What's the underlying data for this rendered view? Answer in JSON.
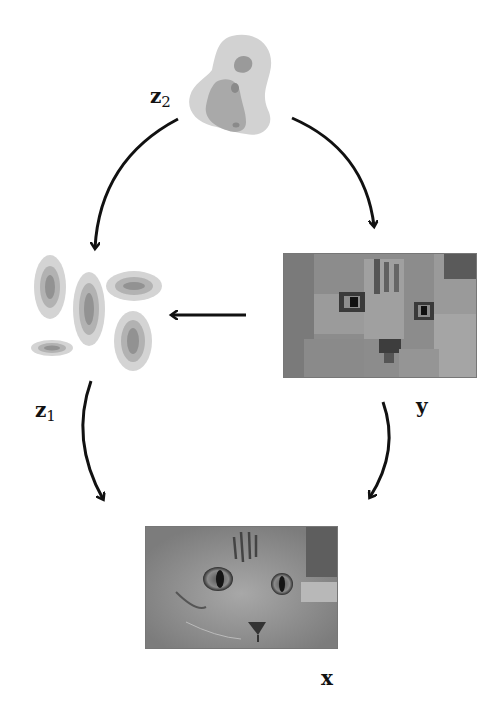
{
  "diagram": {
    "type": "latent-variable-graphical-model",
    "nodes": [
      {
        "id": "z2",
        "label_main": "z",
        "label_sub": "2",
        "depiction": "multimodal density blob (grayscale contour)"
      },
      {
        "id": "z1",
        "label_main": "z",
        "label_sub": "1",
        "depiction": "five elliptical Gaussian density contours"
      },
      {
        "id": "y",
        "label_main": "y",
        "label_sub": "",
        "depiction": "low-resolution (pixelated) cat face image"
      },
      {
        "id": "x",
        "label_main": "x",
        "label_sub": "",
        "depiction": "high-resolution cat face image"
      }
    ],
    "edges": [
      {
        "from": "z2",
        "to": "z1",
        "style": "curved arrow"
      },
      {
        "from": "z2",
        "to": "y",
        "style": "curved arrow"
      },
      {
        "from": "y",
        "to": "z1",
        "style": "straight arrow"
      },
      {
        "from": "z1",
        "to": "x",
        "style": "curved arrow"
      },
      {
        "from": "y",
        "to": "x",
        "style": "curved arrow"
      }
    ],
    "colors": {
      "arrow": "#111111",
      "density_outer": "#d0d0d0",
      "density_mid": "#ababab",
      "density_inner": "#8a8a8a"
    }
  }
}
